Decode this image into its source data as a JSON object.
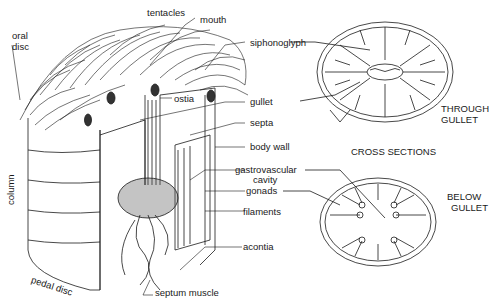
{
  "diagram": {
    "labels": {
      "tentacles": "tentacles",
      "mouth": "mouth",
      "oral_disc_1": "oral",
      "oral_disc_2": "disc",
      "siphonoglyph": "siphonoglyph",
      "ostia": "ostia",
      "gullet": "gullet",
      "septa": "septa",
      "body_wall": "body wall",
      "gastrovascular_1": "gastrovascular",
      "gastrovascular_2": "cavity",
      "gonads": "gonads",
      "filaments": "filaments",
      "acontia": "acontia",
      "column": "column",
      "pedal_disc": "pedal disc",
      "septum_muscle": "septum muscle"
    },
    "captions": {
      "cross_sections": "CROSS SECTIONS",
      "through_gullet_1": "THROUGH",
      "through_gullet_2": "GULLET",
      "below_gullet_1": "BELOW",
      "below_gullet_2": "GULLET"
    },
    "colors": {
      "ink": "#1a1a1a",
      "background": "#ffffff",
      "shade": "#555555"
    }
  }
}
